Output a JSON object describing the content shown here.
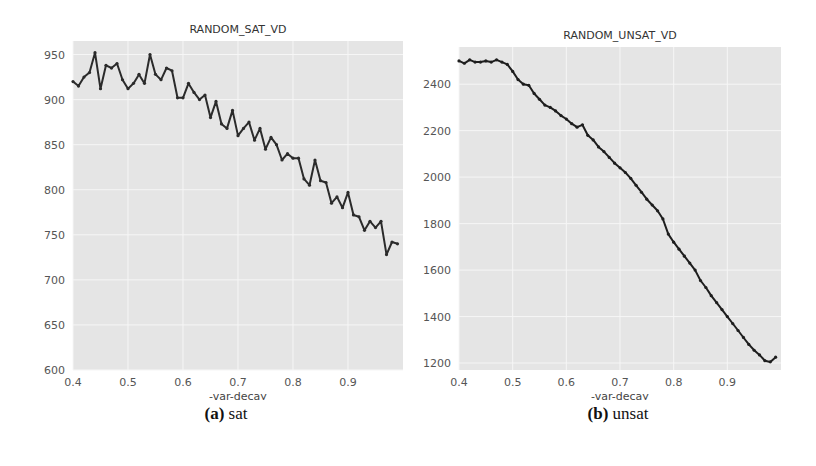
{
  "figure": {
    "captions": [
      {
        "label": "(a)",
        "text": "sat"
      },
      {
        "label": "(b)",
        "text": "unsat"
      }
    ]
  },
  "chart_data": [
    {
      "type": "line",
      "title": "RANDOM_SAT_VD",
      "xlabel": "-var-decay",
      "ylabel": "",
      "xlim": [
        0.4,
        1.0
      ],
      "ylim": [
        600,
        965
      ],
      "xticks": [
        "0.4",
        "0.5",
        "0.6",
        "0.7",
        "0.8",
        "0.9"
      ],
      "yticks": [
        "600",
        "650",
        "700",
        "750",
        "800",
        "850",
        "900",
        "950"
      ],
      "grid": true,
      "legend": null,
      "series": [
        {
          "name": "sat",
          "color": "#2b2b2b",
          "x": [
            0.4,
            0.41,
            0.42,
            0.43,
            0.44,
            0.45,
            0.46,
            0.47,
            0.48,
            0.49,
            0.5,
            0.51,
            0.52,
            0.53,
            0.54,
            0.55,
            0.56,
            0.57,
            0.58,
            0.59,
            0.6,
            0.61,
            0.62,
            0.63,
            0.64,
            0.65,
            0.66,
            0.67,
            0.68,
            0.69,
            0.7,
            0.71,
            0.72,
            0.73,
            0.74,
            0.75,
            0.76,
            0.77,
            0.78,
            0.79,
            0.8,
            0.81,
            0.82,
            0.83,
            0.84,
            0.85,
            0.86,
            0.87,
            0.88,
            0.89,
            0.9,
            0.91,
            0.92,
            0.93,
            0.94,
            0.95,
            0.96,
            0.97,
            0.98,
            0.99
          ],
          "y": [
            920,
            915,
            925,
            930,
            952,
            912,
            938,
            935,
            940,
            922,
            912,
            918,
            928,
            918,
            950,
            928,
            922,
            935,
            932,
            902,
            902,
            918,
            908,
            900,
            905,
            880,
            898,
            873,
            868,
            888,
            860,
            868,
            875,
            855,
            868,
            845,
            858,
            850,
            833,
            840,
            835,
            835,
            812,
            805,
            833,
            810,
            808,
            785,
            792,
            780,
            797,
            772,
            770,
            755,
            765,
            758,
            765,
            728,
            742,
            740
          ]
        }
      ]
    },
    {
      "type": "line",
      "title": "RANDOM_UNSAT_VD",
      "xlabel": "-var-decay",
      "ylabel": "",
      "xlim": [
        0.4,
        1.0
      ],
      "ylim": [
        1170,
        2560
      ],
      "xticks": [
        "0.4",
        "0.5",
        "0.6",
        "0.7",
        "0.8",
        "0.9"
      ],
      "yticks": [
        "1200",
        "1400",
        "1600",
        "1800",
        "2000",
        "2200",
        "2400"
      ],
      "grid": true,
      "legend": null,
      "series": [
        {
          "name": "unsat",
          "color": "#1e1e1e",
          "x": [
            0.4,
            0.41,
            0.42,
            0.43,
            0.44,
            0.45,
            0.46,
            0.47,
            0.48,
            0.49,
            0.5,
            0.51,
            0.52,
            0.53,
            0.54,
            0.55,
            0.56,
            0.57,
            0.58,
            0.59,
            0.6,
            0.61,
            0.62,
            0.63,
            0.64,
            0.65,
            0.66,
            0.67,
            0.68,
            0.69,
            0.7,
            0.71,
            0.72,
            0.73,
            0.74,
            0.75,
            0.76,
            0.77,
            0.78,
            0.79,
            0.8,
            0.81,
            0.82,
            0.83,
            0.84,
            0.85,
            0.86,
            0.87,
            0.88,
            0.89,
            0.9,
            0.91,
            0.92,
            0.93,
            0.94,
            0.95,
            0.96,
            0.97,
            0.98,
            0.99
          ],
          "y": [
            2500,
            2490,
            2505,
            2495,
            2495,
            2500,
            2495,
            2505,
            2495,
            2485,
            2455,
            2420,
            2400,
            2395,
            2360,
            2335,
            2310,
            2300,
            2285,
            2265,
            2250,
            2230,
            2215,
            2225,
            2180,
            2160,
            2130,
            2110,
            2085,
            2060,
            2040,
            2020,
            1995,
            1965,
            1935,
            1905,
            1880,
            1855,
            1820,
            1755,
            1720,
            1690,
            1660,
            1630,
            1600,
            1555,
            1525,
            1490,
            1460,
            1430,
            1400,
            1370,
            1340,
            1310,
            1280,
            1255,
            1235,
            1210,
            1205,
            1225
          ]
        }
      ]
    }
  ]
}
